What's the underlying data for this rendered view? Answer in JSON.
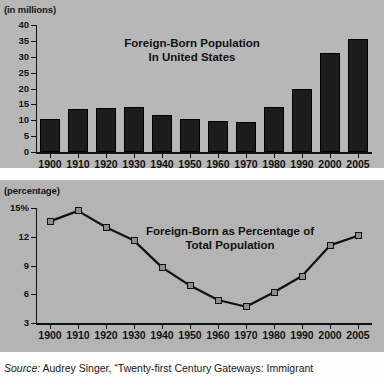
{
  "source": {
    "label": "Source:",
    "text": " Audrey Singer, “Twenty-first Century Gateways: Immigrant"
  },
  "chart_data": [
    {
      "type": "bar",
      "title": "Foreign-Born Population\nIn United States",
      "title_line1": "Foreign-Born Population",
      "title_line2": "In United States",
      "ylabel": "(in millions)",
      "xlabel": "",
      "categories": [
        "1900",
        "1910",
        "1920",
        "1930",
        "1940",
        "1950",
        "1960",
        "1970",
        "1980",
        "1990",
        "2000",
        "2005"
      ],
      "values": [
        10.3,
        13.5,
        13.9,
        14.2,
        11.6,
        10.3,
        9.7,
        9.6,
        14.1,
        19.8,
        31.1,
        35.7
      ],
      "ylim": [
        0,
        40
      ],
      "yticks": [
        "0",
        "5",
        "10",
        "15",
        "20",
        "25",
        "30",
        "35",
        "40"
      ],
      "ytick_values": [
        0,
        5,
        10,
        15,
        20,
        25,
        30,
        35,
        40
      ],
      "grid": false,
      "legend": "none",
      "bar_color": "#1c1c1c"
    },
    {
      "type": "line",
      "title": "Foreign-Born as Percentage of\nTotal Population",
      "title_line1": "Foreign-Born as Percentage of",
      "title_line2": "Total Population",
      "ylabel": "(percentage)",
      "xlabel": "",
      "x": [
        "1900",
        "1910",
        "1920",
        "1930",
        "1940",
        "1950",
        "1960",
        "1970",
        "1980",
        "1990",
        "2000",
        "2005"
      ],
      "values": [
        13.6,
        14.7,
        13.0,
        11.6,
        8.8,
        6.9,
        5.4,
        4.7,
        6.2,
        7.9,
        11.1,
        12.1
      ],
      "ylim": [
        3,
        15
      ],
      "yticks": [
        "3",
        "6",
        "9",
        "12",
        "15%"
      ],
      "ytick_values": [
        3,
        6,
        9,
        12,
        15
      ],
      "grid": false,
      "legend": "none",
      "line_color": "#111111",
      "marker_fill": "#8e8e8e"
    }
  ]
}
